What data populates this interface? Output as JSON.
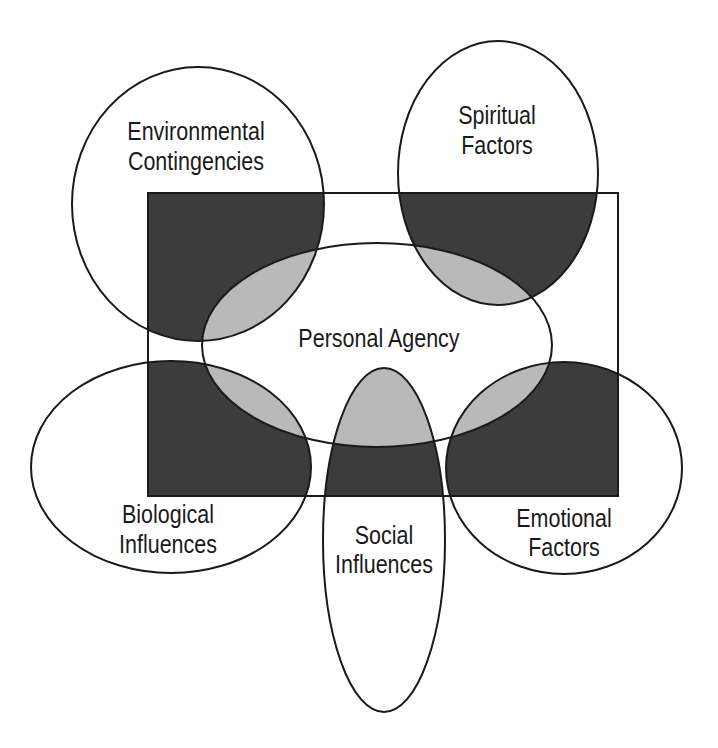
{
  "diagram": {
    "colors": {
      "background": "#ffffff",
      "outline": "#1a1a1a",
      "rect_overlap_fill": "#3c3c3c",
      "agency_overlap_fill": "#b9b9b9"
    },
    "frame": {
      "shape": "rectangle",
      "x": 148,
      "y": 193,
      "width": 470,
      "height": 303
    },
    "center": {
      "label": "Personal Agency",
      "shape": "ellipse",
      "cx": 377,
      "cy": 345,
      "rx": 175,
      "ry": 102
    },
    "factors": [
      {
        "id": "environmental",
        "lines": [
          "Environmental",
          "Contingencies"
        ],
        "cx": 198,
        "cy": 204,
        "rx": 126,
        "ry": 137
      },
      {
        "id": "spiritual",
        "lines": [
          "Spiritual",
          "Factors"
        ],
        "cx": 498,
        "cy": 173,
        "rx": 100,
        "ry": 132
      },
      {
        "id": "biological",
        "lines": [
          "Biological",
          "Influences"
        ],
        "cx": 171,
        "cy": 467,
        "rx": 140,
        "ry": 106
      },
      {
        "id": "social",
        "lines": [
          "Social",
          "Influences"
        ],
        "cx": 384,
        "cy": 540,
        "rx": 61,
        "ry": 172
      },
      {
        "id": "emotional",
        "lines": [
          "Emotional",
          "Factors"
        ],
        "cx": 564,
        "cy": 468,
        "rx": 118,
        "ry": 106
      }
    ]
  }
}
